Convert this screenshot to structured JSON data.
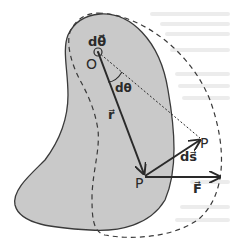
{
  "diagram": {
    "colors": {
      "body_fill": "#c9c9c9",
      "outline": "#3a3a3a",
      "ink": "#2a2a2a",
      "background": "#ffffff"
    },
    "labels": {
      "dtheta_vector": "dθ⃗",
      "origin": "O",
      "angle": "dθ",
      "radius_vector": "r⃗",
      "displacement": "ds⃗",
      "point_initial": "P",
      "point_final": "P",
      "force": "F⃗"
    }
  }
}
